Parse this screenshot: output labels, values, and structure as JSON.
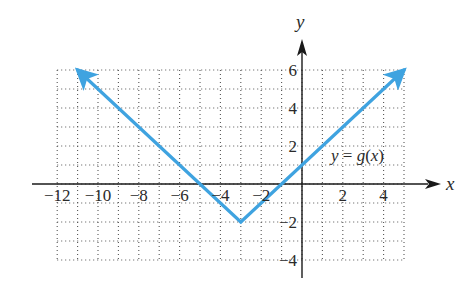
{
  "chart_data": {
    "type": "line",
    "title": "",
    "xlabel": "x",
    "ylabel": "y",
    "xlim": [
      -12,
      5
    ],
    "ylim": [
      -4,
      6
    ],
    "grid": true,
    "grid_style": "dotted",
    "grid_step": 1,
    "x_ticks": [
      -12,
      -10,
      -8,
      -6,
      -4,
      -2,
      2,
      4
    ],
    "x_tick_labels": [
      "−12",
      "−10",
      "−8",
      "−6",
      "−4",
      "−2",
      "2",
      "4"
    ],
    "y_ticks": [
      6,
      4,
      2,
      -2,
      -4
    ],
    "y_tick_labels": [
      "6",
      "4",
      "2",
      "−2",
      "−4"
    ],
    "series": [
      {
        "name": "y = g(x)",
        "equation": "g(x) = |x + 3| − 2",
        "x": [
          -11,
          -3,
          5
        ],
        "y": [
          6,
          -2,
          6
        ],
        "arrows_at_ends": true,
        "color": "#3fa3e0"
      }
    ],
    "annotations": [
      {
        "text": "y = g(x)",
        "x": 2.9,
        "y": 1.5
      }
    ],
    "legend": "none"
  },
  "labels": {
    "x_axis": "x",
    "y_axis": "y",
    "function_y": "y",
    "function_eq": " = ",
    "function_g": "g",
    "function_arg_open": "(",
    "function_arg_x": "x",
    "function_arg_close": ")"
  },
  "colors": {
    "curve": "#3fa3e0",
    "axis": "#1a1a1a",
    "grid": "#555555",
    "text": "#2a2a2a"
  }
}
